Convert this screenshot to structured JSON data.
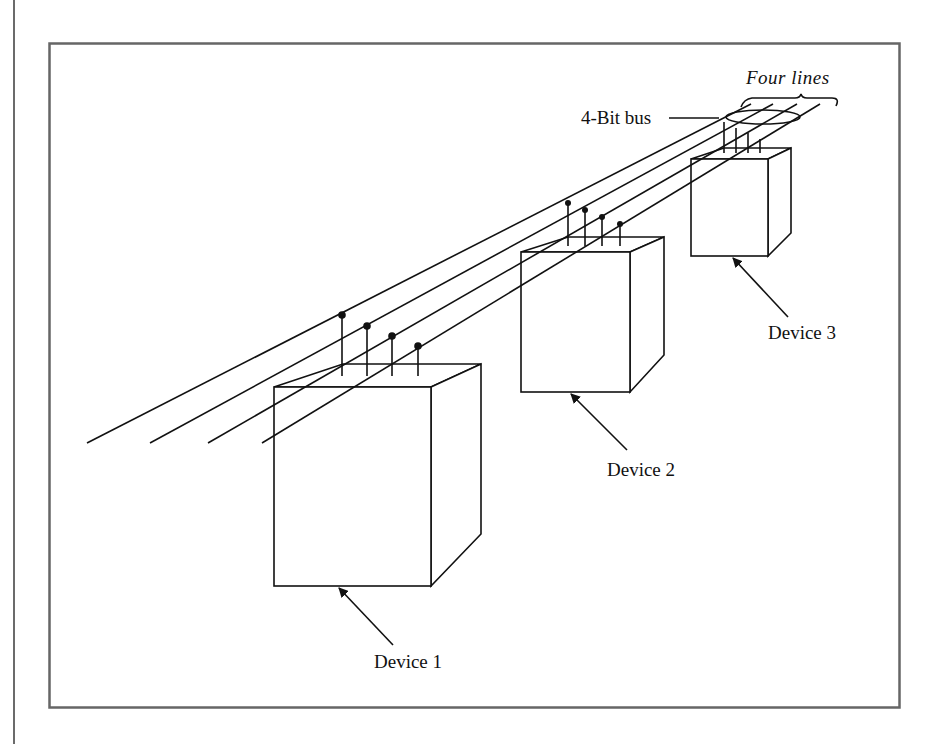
{
  "diagram": {
    "title_labels": {
      "bus_label": "4-Bit bus",
      "lines_label": "Four lines"
    },
    "devices": [
      {
        "label": "Device 1"
      },
      {
        "label": "Device 2"
      },
      {
        "label": "Device 3"
      }
    ],
    "bus": {
      "line_count": 4,
      "description": "Four parallel lines forming a 4-bit bus, each device taps all four lines"
    },
    "colors": {
      "frame": "#666666",
      "stroke": "#111111",
      "background": "#ffffff"
    }
  }
}
